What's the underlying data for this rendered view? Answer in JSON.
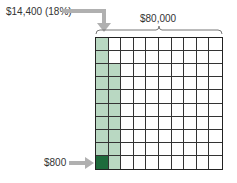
{
  "labels": {
    "highlight": "$14,400 (18%)",
    "total": "$80,000",
    "unit": "$800"
  },
  "grid": {
    "rows": 10,
    "cols": 10,
    "highlighted_cells": 18,
    "unit_cells": 1
  },
  "colors": {
    "highlight": "#b9d8c2",
    "unit": "#1e6b3c",
    "arrow": "#b0b0b0",
    "grid_line": "#333333"
  }
}
